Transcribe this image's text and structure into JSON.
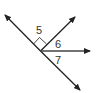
{
  "diagram": {
    "type": "angle-diagram",
    "vertex": {
      "x": 40.5,
      "y": 51
    },
    "rays": [
      {
        "name": "upper-left",
        "to": {
          "x": 4,
          "y": 14
        }
      },
      {
        "name": "lower-right",
        "to": {
          "x": 81,
          "y": 91
        }
      },
      {
        "name": "upper-right",
        "to": {
          "x": 76,
          "y": 16
        }
      },
      {
        "name": "right",
        "to": {
          "x": 91,
          "y": 51
        }
      }
    ],
    "angles": [
      {
        "label": "5",
        "right_angle": true
      },
      {
        "label": "6",
        "right_angle": false
      },
      {
        "label": "7",
        "right_angle": false
      }
    ],
    "colors": {
      "line": "#222222",
      "text": "#333333",
      "background": "#ffffff"
    }
  }
}
